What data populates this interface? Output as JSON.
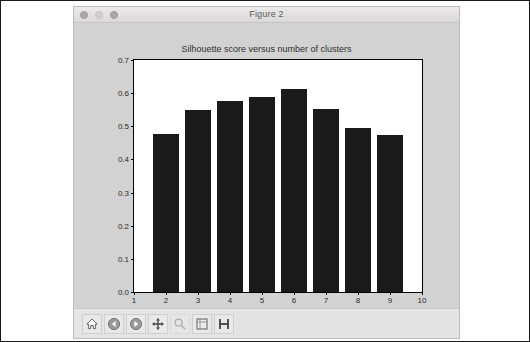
{
  "window": {
    "title": "Figure 2",
    "traffic_lights": [
      "close",
      "minimize",
      "zoom"
    ]
  },
  "toolbar": {
    "buttons": [
      {
        "name": "home-icon",
        "label": "Home",
        "enabled": true
      },
      {
        "name": "back-arrow-icon",
        "label": "Back",
        "enabled": true
      },
      {
        "name": "forward-arrow-icon",
        "label": "Forward",
        "enabled": true
      },
      {
        "name": "pan-move-icon",
        "label": "Pan",
        "enabled": true
      },
      {
        "name": "zoom-rect-icon",
        "label": "Zoom to rectangle",
        "enabled": false
      },
      {
        "name": "configure-subplots-icon",
        "label": "Configure subplots",
        "enabled": true
      },
      {
        "name": "save-disk-icon",
        "label": "Save figure",
        "enabled": true
      }
    ]
  },
  "chart_data": {
    "type": "bar",
    "title": "Silhouette score versus number of clusters",
    "xlabel": "",
    "ylabel": "",
    "categories": [
      2,
      3,
      4,
      5,
      6,
      7,
      8,
      9
    ],
    "values": [
      0.477,
      0.548,
      0.575,
      0.589,
      0.613,
      0.553,
      0.494,
      0.474
    ],
    "xlim": [
      1,
      10
    ],
    "ylim": [
      0.0,
      0.7
    ],
    "xticks": [
      1,
      2,
      3,
      4,
      5,
      6,
      7,
      8,
      9,
      10
    ],
    "xticklabels": [
      "1",
      "2",
      "3",
      "4",
      "5",
      "6",
      "7",
      "8",
      "9",
      "10"
    ],
    "yticks": [
      0.0,
      0.1,
      0.2,
      0.3,
      0.4,
      0.5,
      0.6,
      0.7
    ],
    "yticklabels": [
      "0.0",
      "0.1",
      "0.2",
      "0.3",
      "0.4",
      "0.5",
      "0.6",
      "0.7"
    ],
    "bar_width": 0.8,
    "bar_color": "#1a1a1a",
    "grid": false,
    "legend": null
  }
}
